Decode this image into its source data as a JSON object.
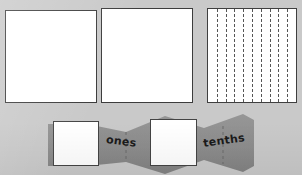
{
  "figure": {
    "kind": "place-value-model-worksheet",
    "background_color": "#c9c9c9",
    "paper_color": "#ffffff",
    "ink_color": "#3c3c3c",
    "strip_color": "#8f8f8f",
    "strip_shadow_color": "#7e7e7e",
    "fold_line_color": "#6b6b6b"
  },
  "squares": [
    {
      "id": "unit-square-1",
      "name": "blank unit square",
      "x": 5,
      "y": 10,
      "w": 92,
      "h": 93,
      "divisions": 0,
      "fill": "#ffffff",
      "border_color": "#3c3c3c"
    },
    {
      "id": "unit-square-2",
      "name": "blank unit square",
      "x": 101,
      "y": 8,
      "w": 92,
      "h": 95,
      "divisions": 0,
      "fill": "#ffffff",
      "border_color": "#3c3c3c"
    },
    {
      "id": "tenths-square",
      "name": "unit square divided into tenths",
      "x": 207,
      "y": 8,
      "w": 90,
      "h": 95,
      "divisions": 10,
      "division_style": "vertical dashed",
      "fill": "#ffffff",
      "border_color": "#3f3f3f"
    }
  ],
  "tenths_grid": {
    "columns": 10,
    "interior_line_count": 9,
    "line_style": "dashed",
    "line_color": "#555555",
    "orientation": "vertical"
  },
  "strip": {
    "id": "accordion-strip",
    "name": "folded place value strip",
    "x": 48,
    "y": 114,
    "w": 206,
    "h": 60,
    "fill": "#8f8f8f",
    "panels": [
      {
        "id": "panel-ones-square",
        "type": "white-square",
        "x": 53,
        "y": 121,
        "w": 46,
        "h": 45
      },
      {
        "id": "panel-ones-label",
        "type": "label",
        "label": "ones",
        "x": 110,
        "y": 136,
        "rotation": 7
      },
      {
        "id": "panel-tenths-square",
        "type": "white-square",
        "x": 150,
        "y": 119,
        "w": 47,
        "h": 47
      },
      {
        "id": "panel-tenths-label",
        "type": "label",
        "label": "tenths",
        "x": 206,
        "y": 136,
        "rotation": -8
      }
    ],
    "fold_lines": [
      {
        "id": "fold-line-1",
        "x": 126
      },
      {
        "id": "fold-line-2",
        "x": 223
      }
    ]
  },
  "labels": {
    "ones": "ones",
    "tenths": "tenths"
  }
}
